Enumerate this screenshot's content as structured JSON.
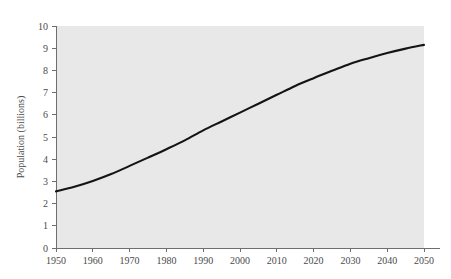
{
  "chart_data": {
    "type": "line",
    "title": "",
    "subtitle": "",
    "xlabel": "",
    "ylabel": "Population (billions)",
    "xlim": [
      1950,
      2050
    ],
    "ylim": [
      0,
      10
    ],
    "grid": false,
    "legend": "none",
    "plot_background_color": "#e8e8e8",
    "page_background_color": "#ffffff",
    "line_color": "#141414",
    "axis_color": "#6e6e6e",
    "text_color": "#4a4a4a",
    "x_ticks": [
      1950,
      1960,
      1970,
      1980,
      1990,
      2000,
      2010,
      2020,
      2030,
      2040,
      2050
    ],
    "x_tick_labels": [
      "1950",
      "1960",
      "1970",
      "1980",
      "1990",
      "2000",
      "2010",
      "2020",
      "2030",
      "2040",
      "2050"
    ],
    "y_ticks": [
      0,
      1,
      2,
      3,
      4,
      5,
      6,
      7,
      8,
      9,
      10
    ],
    "y_tick_labels": [
      "0",
      "1",
      "2",
      "3",
      "4",
      "5",
      "6",
      "7",
      "8",
      "9",
      "10"
    ],
    "series": [
      {
        "name": "World population",
        "x": [
          1950,
          1955,
          1960,
          1965,
          1970,
          1975,
          1980,
          1985,
          1990,
          1995,
          2000,
          2005,
          2010,
          2015,
          2020,
          2025,
          2030,
          2035,
          2040,
          2045,
          2050
        ],
        "values": [
          2.55,
          2.76,
          3.02,
          3.33,
          3.7,
          4.07,
          4.45,
          4.85,
          5.3,
          5.7,
          6.1,
          6.5,
          6.9,
          7.3,
          7.65,
          7.98,
          8.3,
          8.55,
          8.78,
          8.98,
          9.15
        ]
      }
    ]
  }
}
